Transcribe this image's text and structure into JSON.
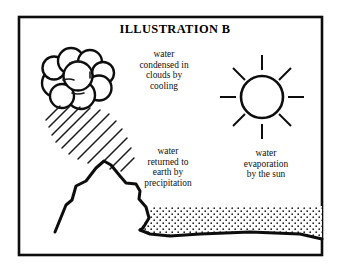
{
  "figure": {
    "title": "ILLUSTRATION B",
    "border_color": "#000000",
    "background_color": "#ffffff",
    "ink_color": "#000000"
  },
  "labels": {
    "condensation": {
      "name": "water-condensed-in-clouds-by-cooling",
      "lines": [
        "water",
        "condensed in",
        "clouds by",
        "cooling"
      ]
    },
    "precipitation": {
      "name": "water-returned-to-earth-by-precipitation",
      "lines": [
        "water",
        "returned to",
        "earth by",
        "precipitation"
      ]
    },
    "evaporation": {
      "name": "water-evaporation-by-the-sun",
      "lines": [
        "water",
        "evaporation",
        "by the sun"
      ]
    }
  },
  "elements": {
    "cloud": "cloud-icon",
    "rain": "rain-streaks-icon",
    "sun": "sun-icon",
    "mountain": "mountain-icon",
    "water_body": "water-body-icon"
  }
}
